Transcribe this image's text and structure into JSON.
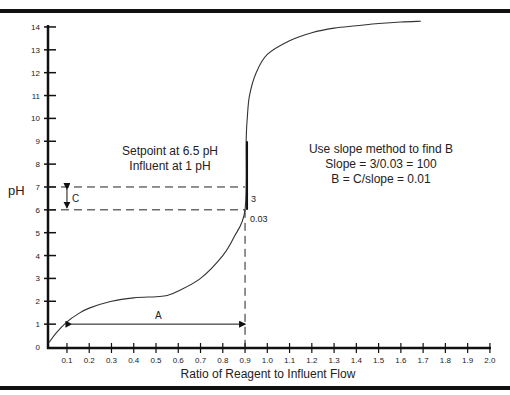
{
  "chart_data": {
    "type": "line",
    "title": "",
    "xlabel": "Ratio of Reagent to Influent Flow",
    "ylabel": "pH",
    "xlim": [
      0,
      2.0
    ],
    "ylim": [
      0,
      14
    ],
    "x_ticks": [
      "0.1",
      "0.2",
      "0.3",
      "0.4",
      "0.5",
      "0.6",
      "0.7",
      "0.8",
      "0.9",
      "1.0",
      "1.1",
      "1.2",
      "1.3",
      "1.4",
      "1.5",
      "1.6",
      "1.7",
      "1.8",
      "1.9",
      "2.0"
    ],
    "y_ticks": [
      "0",
      "1",
      "2",
      "3",
      "4",
      "5",
      "6",
      "7",
      "8",
      "9",
      "10",
      "11",
      "12",
      "13",
      "14"
    ],
    "grid": false,
    "series": [
      {
        "name": "Titration curve",
        "x": [
          0.02,
          0.05,
          0.1,
          0.15,
          0.2,
          0.3,
          0.4,
          0.5,
          0.55,
          0.6,
          0.7,
          0.8,
          0.85,
          0.9,
          0.905,
          0.91,
          0.92,
          0.95,
          1.0,
          1.1,
          1.2,
          1.3,
          1.4,
          1.5,
          1.6,
          1.69
        ],
        "y": [
          0.2,
          0.6,
          1.1,
          1.45,
          1.7,
          2.0,
          2.15,
          2.2,
          2.25,
          2.45,
          3.0,
          4.0,
          4.8,
          6.0,
          9.0,
          10.0,
          11.0,
          12.0,
          12.8,
          13.4,
          13.75,
          13.95,
          14.05,
          14.15,
          14.22,
          14.25
        ]
      }
    ],
    "annotations": {
      "setpoint_line_1": "Setpoint at 6.5 pH",
      "setpoint_line_2": "Influent at 1 pH",
      "slope_line_1": "Use slope method to find B",
      "slope_line_2": "Slope = 3/0.03 = 100",
      "slope_line_3": "B = C/slope = 0.01",
      "label_A": "A",
      "label_C": "C",
      "label_rise": "3",
      "label_run": "0.03",
      "dashed_h_lines_pH": [
        7,
        6
      ],
      "dashed_v_line_x": 0.9,
      "arrow_A": {
        "from_x": 0.12,
        "to_x": 0.9,
        "pH": 1
      },
      "arrow_C": {
        "x": 0.1,
        "from_pH": 7,
        "to_pH": 6
      }
    }
  }
}
